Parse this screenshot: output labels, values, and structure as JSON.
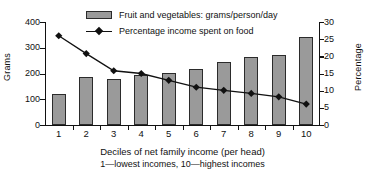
{
  "chart_data": {
    "type": "bar",
    "title": "",
    "categories": [
      "1",
      "2",
      "3",
      "4",
      "5",
      "6",
      "7",
      "8",
      "9",
      "10"
    ],
    "xlabel": "Deciles of net family income (per head)",
    "xlabel_note": "1—lowest incomes, 10—highest incomes",
    "ylabel": "Grams",
    "ylabel_secondary": "Percentage",
    "ylim": [
      0,
      400
    ],
    "ylim_secondary": [
      0,
      30
    ],
    "yticks": [
      0,
      100,
      200,
      300,
      400
    ],
    "yticks_secondary": [
      0,
      5,
      10,
      15,
      20,
      25,
      30
    ],
    "grid": false,
    "legend_position": "top-center",
    "series": [
      {
        "name": "Fruit and vegetables: grams/person/day",
        "type": "bar",
        "axis": "left",
        "unit": "grams/person/day",
        "color": "#9a9a9a",
        "edge_color": "#2b2b2b",
        "values": [
          120,
          186,
          179,
          193,
          202,
          217,
          246,
          263,
          270,
          343
        ]
      },
      {
        "name": "Percentage income spent on food",
        "type": "line",
        "axis": "right",
        "unit": "%",
        "color": "#111111",
        "marker": "diamond",
        "values": [
          26.0,
          20.8,
          15.8,
          15.0,
          13.0,
          11.0,
          10.1,
          9.2,
          8.2,
          6.1
        ]
      }
    ]
  },
  "legend": {
    "items": [
      {
        "label": "Fruit and vegetables: grams/person/day",
        "marker": "bar-swatch"
      },
      {
        "label": "Percentage income spent on food",
        "marker": "line-diamond"
      }
    ]
  },
  "axes": {
    "left_title": "Grams",
    "right_title": "Percentage"
  },
  "caption": {
    "main": "Deciles of net family income (per head)",
    "sub": "1—lowest incomes, 10—highest incomes"
  }
}
